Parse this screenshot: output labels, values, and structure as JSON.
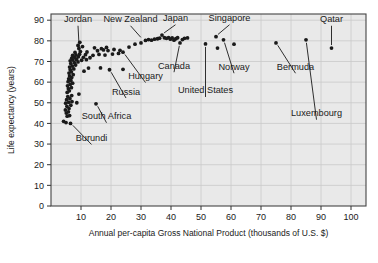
{
  "chart_data": {
    "type": "scatter",
    "title": "",
    "xlabel": "Annual per-capita Gross National Product (thousands of U.S. $)",
    "ylabel": "Life expectancy (years)",
    "xlim": [
      0,
      105
    ],
    "ylim": [
      0,
      93
    ],
    "xticks": [
      10,
      20,
      30,
      40,
      50,
      60,
      70,
      80,
      90,
      100
    ],
    "yticks": [
      0,
      10,
      20,
      30,
      40,
      50,
      60,
      70,
      80,
      90
    ],
    "grid": true,
    "grid_color": "#c9c9c9",
    "plot_bg": "#e9e9e9",
    "point_color": "#1a1a1a",
    "legend": "none",
    "annotations": [
      {
        "label": "Jordan",
        "x": 9.5,
        "y": 73.5,
        "lx": 9.0,
        "ly": 89.0,
        "anchor": "middle"
      },
      {
        "label": "New Zealand",
        "x": 30.5,
        "y": 80.5,
        "lx": 26.5,
        "ly": 89.0,
        "anchor": "middle"
      },
      {
        "label": "Japan",
        "x": 37.0,
        "y": 82.8,
        "lx": 41.5,
        "ly": 89.5,
        "anchor": "middle"
      },
      {
        "label": "Singapore",
        "x": 55.0,
        "y": 82.0,
        "lx": 59.5,
        "ly": 89.5,
        "anchor": "middle"
      },
      {
        "label": "Qatar",
        "x": 93.5,
        "y": 76.5,
        "lx": 93.5,
        "ly": 89.0,
        "anchor": "middle"
      },
      {
        "label": "Canada",
        "x": 43.0,
        "y": 79.0,
        "lx": 41.0,
        "ly": 66.5,
        "anchor": "middle"
      },
      {
        "label": "Norway",
        "x": 57.5,
        "y": 80.5,
        "lx": 61.0,
        "ly": 66.0,
        "anchor": "middle"
      },
      {
        "label": "Bermuda",
        "x": 75.0,
        "y": 79.0,
        "lx": 81.5,
        "ly": 66.0,
        "anchor": "middle"
      },
      {
        "label": "United States",
        "x": 51.5,
        "y": 78.5,
        "lx": 51.5,
        "ly": 54.5,
        "anchor": "middle"
      },
      {
        "label": "Hungary",
        "x": 24.0,
        "y": 74.5,
        "lx": 31.5,
        "ly": 61.5,
        "anchor": "middle"
      },
      {
        "label": "Russia",
        "x": 19.5,
        "y": 66.0,
        "lx": 25.0,
        "ly": 54.0,
        "anchor": "middle"
      },
      {
        "label": "South Africa",
        "x": 15.0,
        "y": 49.5,
        "lx": 18.5,
        "ly": 42.0,
        "anchor": "middle"
      },
      {
        "label": "Burundi",
        "x": 6.5,
        "y": 40.0,
        "lx": 13.5,
        "ly": 31.5,
        "anchor": "middle"
      },
      {
        "label": "Luxembourg",
        "x": 85.0,
        "y": 80.5,
        "lx": 88.5,
        "ly": 43.5,
        "anchor": "middle"
      }
    ],
    "points": [
      {
        "x": 4.2,
        "y": 41.0
      },
      {
        "x": 5.0,
        "y": 40.4
      },
      {
        "x": 6.5,
        "y": 40.0
      },
      {
        "x": 5.4,
        "y": 43.5
      },
      {
        "x": 6.2,
        "y": 43.8
      },
      {
        "x": 5.1,
        "y": 45.0
      },
      {
        "x": 5.8,
        "y": 45.6
      },
      {
        "x": 4.8,
        "y": 46.5
      },
      {
        "x": 6.0,
        "y": 47.2
      },
      {
        "x": 5.3,
        "y": 48.3
      },
      {
        "x": 6.6,
        "y": 48.8
      },
      {
        "x": 4.9,
        "y": 49.8
      },
      {
        "x": 5.9,
        "y": 50.2
      },
      {
        "x": 7.0,
        "y": 50.6
      },
      {
        "x": 8.6,
        "y": 50.0
      },
      {
        "x": 15.0,
        "y": 49.5
      },
      {
        "x": 5.2,
        "y": 51.5
      },
      {
        "x": 6.3,
        "y": 52.0
      },
      {
        "x": 5.6,
        "y": 53.0
      },
      {
        "x": 6.9,
        "y": 53.5
      },
      {
        "x": 9.3,
        "y": 54.2
      },
      {
        "x": 5.4,
        "y": 55.0
      },
      {
        "x": 6.1,
        "y": 55.8
      },
      {
        "x": 5.8,
        "y": 56.8
      },
      {
        "x": 6.8,
        "y": 57.3
      },
      {
        "x": 5.5,
        "y": 58.2
      },
      {
        "x": 6.4,
        "y": 58.9
      },
      {
        "x": 7.2,
        "y": 59.5
      },
      {
        "x": 5.7,
        "y": 60.2
      },
      {
        "x": 6.6,
        "y": 60.8
      },
      {
        "x": 5.9,
        "y": 61.6
      },
      {
        "x": 6.9,
        "y": 62.2
      },
      {
        "x": 6.2,
        "y": 63.0
      },
      {
        "x": 7.4,
        "y": 63.6
      },
      {
        "x": 6.0,
        "y": 64.4
      },
      {
        "x": 6.8,
        "y": 65.0
      },
      {
        "x": 11.0,
        "y": 65.3
      },
      {
        "x": 6.4,
        "y": 66.0
      },
      {
        "x": 7.6,
        "y": 66.4
      },
      {
        "x": 12.5,
        "y": 66.8
      },
      {
        "x": 16.5,
        "y": 66.9
      },
      {
        "x": 19.5,
        "y": 66.0
      },
      {
        "x": 24.0,
        "y": 66.2
      },
      {
        "x": 6.2,
        "y": 67.3
      },
      {
        "x": 7.1,
        "y": 67.8
      },
      {
        "x": 8.2,
        "y": 68.3
      },
      {
        "x": 6.6,
        "y": 69.0
      },
      {
        "x": 7.8,
        "y": 69.4
      },
      {
        "x": 9.0,
        "y": 69.8
      },
      {
        "x": 6.4,
        "y": 70.3
      },
      {
        "x": 7.3,
        "y": 70.7
      },
      {
        "x": 8.5,
        "y": 71.0
      },
      {
        "x": 10.2,
        "y": 70.6
      },
      {
        "x": 11.8,
        "y": 70.9
      },
      {
        "x": 6.9,
        "y": 71.6
      },
      {
        "x": 7.9,
        "y": 72.0
      },
      {
        "x": 9.1,
        "y": 72.3
      },
      {
        "x": 10.8,
        "y": 72.0
      },
      {
        "x": 13.0,
        "y": 71.8
      },
      {
        "x": 7.2,
        "y": 72.9
      },
      {
        "x": 8.3,
        "y": 73.2
      },
      {
        "x": 9.5,
        "y": 73.5
      },
      {
        "x": 11.5,
        "y": 73.3
      },
      {
        "x": 14.0,
        "y": 73.0
      },
      {
        "x": 16.0,
        "y": 73.4
      },
      {
        "x": 18.0,
        "y": 73.1
      },
      {
        "x": 20.5,
        "y": 73.6
      },
      {
        "x": 22.5,
        "y": 73.9
      },
      {
        "x": 24.0,
        "y": 74.5
      },
      {
        "x": 8.0,
        "y": 74.4
      },
      {
        "x": 9.8,
        "y": 74.8
      },
      {
        "x": 12.0,
        "y": 74.6
      },
      {
        "x": 15.5,
        "y": 75.2
      },
      {
        "x": 17.5,
        "y": 75.6
      },
      {
        "x": 19.0,
        "y": 75.3
      },
      {
        "x": 21.0,
        "y": 75.8
      },
      {
        "x": 23.0,
        "y": 75.4
      },
      {
        "x": 9.3,
        "y": 76.3
      },
      {
        "x": 14.5,
        "y": 76.6
      },
      {
        "x": 16.8,
        "y": 76.2
      },
      {
        "x": 18.5,
        "y": 76.8
      },
      {
        "x": 26.0,
        "y": 77.0
      },
      {
        "x": 9.0,
        "y": 77.8
      },
      {
        "x": 10.5,
        "y": 77.2
      },
      {
        "x": 28.0,
        "y": 78.4
      },
      {
        "x": 30.0,
        "y": 79.0
      },
      {
        "x": 9.6,
        "y": 79.3
      },
      {
        "x": 31.5,
        "y": 80.2
      },
      {
        "x": 32.5,
        "y": 80.6
      },
      {
        "x": 33.5,
        "y": 80.3
      },
      {
        "x": 34.5,
        "y": 80.8
      },
      {
        "x": 35.5,
        "y": 81.0
      },
      {
        "x": 36.2,
        "y": 81.3
      },
      {
        "x": 37.0,
        "y": 82.8
      },
      {
        "x": 37.8,
        "y": 81.5
      },
      {
        "x": 38.5,
        "y": 81.2
      },
      {
        "x": 39.2,
        "y": 81.6
      },
      {
        "x": 39.8,
        "y": 80.8
      },
      {
        "x": 40.4,
        "y": 81.4
      },
      {
        "x": 41.0,
        "y": 80.3
      },
      {
        "x": 41.6,
        "y": 81.0
      },
      {
        "x": 42.2,
        "y": 81.5
      },
      {
        "x": 43.0,
        "y": 79.0
      },
      {
        "x": 43.8,
        "y": 80.6
      },
      {
        "x": 44.5,
        "y": 81.2
      },
      {
        "x": 45.5,
        "y": 81.4
      },
      {
        "x": 51.5,
        "y": 78.5
      },
      {
        "x": 55.0,
        "y": 82.0
      },
      {
        "x": 55.5,
        "y": 76.5
      },
      {
        "x": 57.5,
        "y": 80.5
      },
      {
        "x": 61.0,
        "y": 78.4
      },
      {
        "x": 75.0,
        "y": 79.0
      },
      {
        "x": 85.0,
        "y": 80.5
      },
      {
        "x": 93.5,
        "y": 76.5
      }
    ]
  }
}
